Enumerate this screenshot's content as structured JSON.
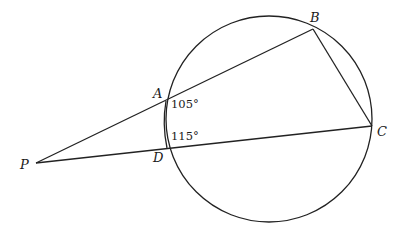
{
  "diagram": {
    "type": "geometry",
    "circle": {
      "cx": 269,
      "cy": 119,
      "r": 103
    },
    "points": {
      "P": {
        "label": "P",
        "x": 36,
        "y": 163
      },
      "A": {
        "label": "A",
        "x": 166,
        "y": 101
      },
      "B": {
        "label": "B",
        "x": 313,
        "y": 29
      },
      "C": {
        "label": "C",
        "x": 372,
        "y": 126
      },
      "D": {
        "label": "D",
        "x": 167,
        "y": 148
      }
    },
    "angles": {
      "at_A": "105°",
      "at_D": "115°"
    },
    "segments": [
      "PB",
      "PC",
      "BC",
      "AD"
    ]
  }
}
